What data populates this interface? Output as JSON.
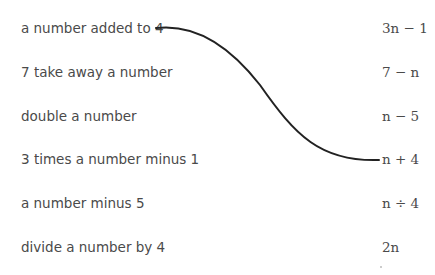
{
  "phrases": [
    {
      "label": "a number added to 4"
    },
    {
      "label": "7 take away a number"
    },
    {
      "label": "double a number"
    },
    {
      "label": "3 times a number minus 1"
    },
    {
      "label": "a number minus 5"
    },
    {
      "label": "divide a number by 4"
    }
  ],
  "expressions": [
    {
      "label": "3n − 1"
    },
    {
      "label": "7 − n"
    },
    {
      "label": "n − 5"
    },
    {
      "label": "n + 4"
    },
    {
      "label": "n ÷ 4"
    },
    {
      "label": "2n"
    }
  ],
  "connections": [
    {
      "from": "a number added to 4",
      "to": "n + 4"
    }
  ],
  "line_color": "#222222"
}
